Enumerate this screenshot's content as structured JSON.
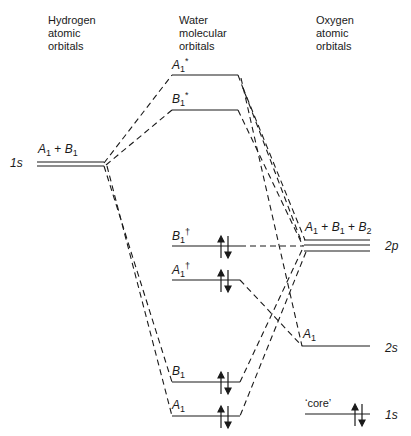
{
  "columns": {
    "hydrogen": "Hydrogen\natomic\norbitals",
    "water": "Water\nmolecular\norbitals",
    "oxygen": "Oxygen\natomic\norbitals"
  },
  "hydrogen": {
    "level_label": "1s",
    "symmetry": {
      "a": "A",
      "a_sub": "1",
      "plus": " + ",
      "b": "B",
      "b_sub": "1"
    }
  },
  "water_mos": [
    {
      "id": "A1*",
      "sym": "A",
      "sub": "1",
      "sup": "*",
      "occupied": false
    },
    {
      "id": "B1*",
      "sym": "B",
      "sub": "1",
      "sup": "*",
      "occupied": false
    },
    {
      "id": "B1†",
      "sym": "B",
      "sub": "1",
      "sup": "†",
      "occupied": true
    },
    {
      "id": "A1†",
      "sym": "A",
      "sub": "1",
      "sup": "†",
      "occupied": true
    },
    {
      "id": "B1",
      "sym": "B",
      "sub": "1",
      "sup": "",
      "occupied": true
    },
    {
      "id": "A1",
      "sym": "A",
      "sub": "1",
      "sup": "",
      "occupied": true
    }
  ],
  "oxygen": {
    "p": {
      "label": "2p",
      "sym1": "A",
      "sub1": "1",
      "sym2": "B",
      "sub2": "1",
      "sym3": "B",
      "sub3": "2",
      "plus": " + "
    },
    "s": {
      "label": "2s",
      "sym": "A",
      "sub": "1"
    },
    "core": {
      "label": "1s",
      "tag": "‘core’"
    }
  },
  "colors": {
    "line": "#1a1a1a",
    "background": "#ffffff"
  }
}
